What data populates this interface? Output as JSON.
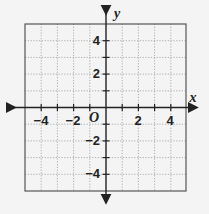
{
  "diagram": {
    "type": "coordinate-plane",
    "x_axis": {
      "label": "x",
      "min": -5,
      "max": 5,
      "tick_labels": [
        "−4",
        "−2",
        "2",
        "4"
      ],
      "tick_values": [
        -4,
        -2,
        2,
        4
      ]
    },
    "y_axis": {
      "label": "y",
      "min": -5,
      "max": 5,
      "tick_labels": [
        "4",
        "2",
        "−2",
        "−4"
      ],
      "tick_values": [
        4,
        2,
        -2,
        -4
      ]
    },
    "origin_label": "O",
    "grid": {
      "step": 1,
      "style": "dotted"
    },
    "colors": {
      "axis": "#222222",
      "grid": "#999999",
      "border": "#555555",
      "background": "#f4f4f4"
    }
  }
}
